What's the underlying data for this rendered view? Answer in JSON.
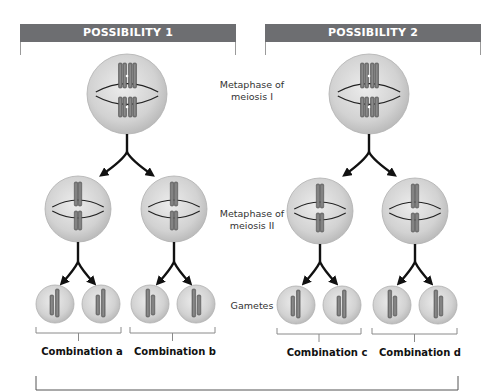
{
  "possibilities": [
    {
      "title": "POSSIBILITY 1"
    },
    {
      "title": "POSSIBILITY 2"
    }
  ],
  "stage_labels": {
    "metaphase_1": "Metaphase of\nmeiosis I",
    "metaphase_1_line1": "Metaphase of",
    "metaphase_1_line2": "meiosis I",
    "metaphase_2_line1": "Metaphase of",
    "metaphase_2_line2": "meiosis II",
    "gametes": "Gametes"
  },
  "combinations": [
    {
      "label": "Combination a"
    },
    {
      "label": "Combination b"
    },
    {
      "label": "Combination c"
    },
    {
      "label": "Combination d"
    }
  ],
  "colors": {
    "header": "#6d6e71",
    "cell_fill": "#d4d4d4",
    "cell_edge": "#b0b0b0",
    "chromosome": "#7a7a7a",
    "arrow": "#111111"
  }
}
